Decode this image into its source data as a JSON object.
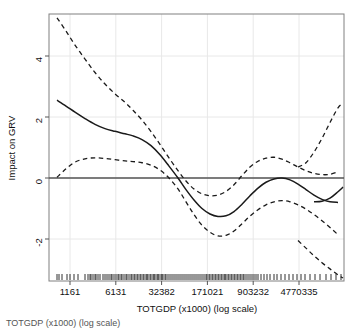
{
  "figure": {
    "background": "#ffffff",
    "plot_box": {
      "left": 49,
      "top": 14,
      "right": 344,
      "bottom": 281
    },
    "line_color": "#1a1a1a",
    "grid_color": "#e8e8e8",
    "box_color": "#808080"
  },
  "chart_data": {
    "type": "line",
    "title": "",
    "subtitle": "",
    "xlabel": "TOTGDP (x1000) (log scale)",
    "ylabel": "Impact on GRV",
    "grid": true,
    "legend": "none",
    "x_scale": "log",
    "x_tick_labels": [
      "1161",
      "6131",
      "32382",
      "171021",
      "903232",
      "4770335"
    ],
    "x_tick_positions_px": [
      70,
      115.8,
      161.6,
      207.4,
      253.2,
      299
    ],
    "y_tick_labels": [
      "-2",
      "0",
      "2",
      "4"
    ],
    "y_tick_values": [
      -2,
      0,
      2,
      4
    ],
    "y_tick_positions_px": [
      239,
      178,
      117,
      56
    ],
    "ylim": [
      -3.4,
      5.3
    ],
    "reference_line_y": 0,
    "series": [
      {
        "name": "fitted-smooth",
        "style": "solid",
        "x_px": [
          57,
          66,
          75,
          85,
          95,
          105,
          115,
          125,
          133,
          142,
          151,
          160,
          169,
          178,
          186,
          194,
          202,
          210,
          218,
          226,
          234,
          242,
          250,
          258,
          266,
          274,
          282,
          290,
          298,
          306,
          314,
          322,
          330,
          338
        ],
        "values": [
          2.55,
          2.36,
          2.16,
          1.95,
          1.76,
          1.62,
          1.53,
          1.45,
          1.38,
          1.26,
          1.06,
          0.76,
          0.39,
          0.0,
          -0.38,
          -0.72,
          -1.0,
          -1.18,
          -1.26,
          -1.24,
          -1.1,
          -0.86,
          -0.58,
          -0.33,
          -0.14,
          -0.03,
          0.0,
          -0.06,
          -0.2,
          -0.38,
          -0.56,
          -0.7,
          -0.78,
          -0.8
        ]
      },
      {
        "name": "upper-confidence-band",
        "style": "dashed",
        "x_px": [
          57,
          66,
          75,
          85,
          95,
          105,
          115,
          125,
          133,
          142,
          151,
          160,
          169,
          178,
          186,
          194,
          202,
          210,
          218,
          226,
          234,
          242,
          250,
          258,
          266,
          274,
          282,
          290,
          298,
          306,
          314,
          322,
          330,
          338
        ],
        "values": [
          5.25,
          4.82,
          4.36,
          3.9,
          3.46,
          3.08,
          2.76,
          2.48,
          2.22,
          1.9,
          1.52,
          1.1,
          0.66,
          0.24,
          -0.1,
          -0.36,
          -0.52,
          -0.58,
          -0.56,
          -0.44,
          -0.22,
          0.08,
          0.36,
          0.55,
          0.65,
          0.68,
          0.62,
          0.5,
          0.36,
          0.24,
          0.15,
          0.11,
          0.12,
          0.2
        ]
      },
      {
        "name": "lower-confidence-band",
        "style": "dashed",
        "x_px": [
          57,
          66,
          75,
          85,
          95,
          105,
          115,
          125,
          133,
          142,
          151,
          160,
          169,
          178,
          186,
          194,
          202,
          210,
          218,
          226,
          234,
          242,
          250,
          258,
          266,
          274,
          282,
          290,
          298,
          306,
          314,
          322,
          330,
          338
        ],
        "values": [
          0.02,
          0.3,
          0.52,
          0.63,
          0.66,
          0.64,
          0.6,
          0.56,
          0.54,
          0.5,
          0.42,
          0.26,
          0.0,
          -0.36,
          -0.78,
          -1.2,
          -1.55,
          -1.78,
          -1.9,
          -1.88,
          -1.74,
          -1.5,
          -1.25,
          -1.04,
          -0.88,
          -0.78,
          -0.74,
          -0.78,
          -0.88,
          -1.02,
          -1.2,
          -1.4,
          -1.62,
          -1.86
        ]
      },
      {
        "name": "upper-band-right-tail",
        "style": "dashed",
        "x_px": [
          298,
          306,
          314,
          322,
          330,
          338,
          343
        ],
        "values": [
          0.36,
          0.5,
          0.85,
          1.3,
          1.82,
          2.3,
          2.45
        ]
      },
      {
        "name": "lower-band-right-tail",
        "style": "dashed",
        "x_px": [
          298,
          306,
          314,
          322,
          330,
          338,
          343
        ],
        "values": [
          -2.05,
          -2.3,
          -2.55,
          -2.78,
          -2.98,
          -3.18,
          -3.28
        ]
      },
      {
        "name": "solid-right-tail",
        "style": "solid",
        "x_px": [
          314,
          322,
          330,
          338,
          343
        ],
        "values": [
          -0.78,
          -0.76,
          -0.66,
          -0.45,
          -0.3
        ]
      }
    ],
    "rug_marks_px": [
      57,
      59,
      62,
      67,
      70,
      74,
      78,
      85,
      88,
      90,
      91,
      93,
      95,
      96,
      98,
      100,
      103,
      105,
      107,
      109,
      111,
      112,
      114,
      116,
      118,
      119,
      121,
      122,
      124,
      126,
      127,
      129,
      131,
      132,
      134,
      135,
      137,
      138,
      140,
      141,
      143,
      144,
      146,
      147,
      148,
      150,
      151,
      153,
      154,
      155,
      157,
      158,
      159,
      161,
      162,
      163,
      165,
      166,
      168,
      170,
      172,
      174,
      176,
      178,
      180,
      182,
      184,
      186,
      188,
      190,
      192,
      194,
      196,
      198,
      200,
      202,
      204,
      206,
      207,
      209,
      210,
      212,
      213,
      215,
      216,
      218,
      219,
      221,
      222,
      224,
      225,
      226,
      228,
      229,
      231,
      232,
      234,
      235,
      237,
      238,
      240,
      241,
      243,
      244,
      246,
      248,
      250,
      252,
      254,
      256,
      258,
      261,
      264,
      267,
      270,
      274,
      277,
      281,
      285,
      289,
      293,
      297,
      301,
      305,
      310,
      315,
      320,
      326,
      331,
      336,
      341
    ]
  },
  "caption": {
    "text": "TOTGDP (x1000) (log scale)"
  }
}
